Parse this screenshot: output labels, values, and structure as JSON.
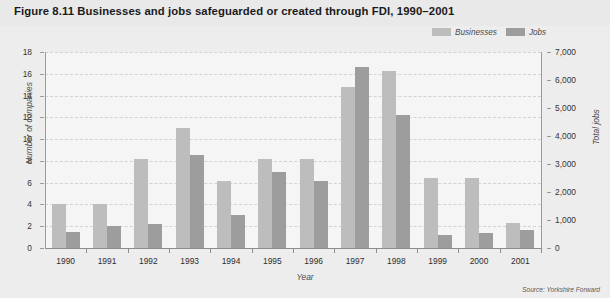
{
  "figure": {
    "title": "Figure 8.11  Businesses and jobs safeguarded or created through FDI, 1990–2001",
    "source": "Source: Yorkshire Forward"
  },
  "legend": {
    "position": "top-right",
    "items": [
      {
        "label": "Businesses",
        "color": "#bdbdbd"
      },
      {
        "label": "Jobs",
        "color": "#9d9d9d"
      }
    ]
  },
  "colors": {
    "businesses": "#bdbdbd",
    "jobs": "#9d9d9d",
    "plot_background": "#f5f5f5",
    "page_background": "#ededee",
    "gridline": "#d2d2d2",
    "axis": "#9a9a9a"
  },
  "chart_data": {
    "type": "bar",
    "title": "Figure 8.11  Businesses and jobs safeguarded or created through FDI, 1990–2001",
    "xlabel": "Year",
    "ylabel": "Number of companies",
    "y2label": "Total jobs",
    "categories": [
      "1990",
      "1991",
      "1992",
      "1993",
      "1994",
      "1995",
      "1996",
      "1997",
      "1998",
      "1999",
      "2000",
      "2001"
    ],
    "series": [
      {
        "name": "Businesses",
        "axis": "left",
        "unit": "companies",
        "color": "#bdbdbd",
        "values": [
          4.0,
          4.0,
          8.2,
          11.0,
          6.2,
          8.2,
          8.2,
          14.8,
          16.3,
          6.4,
          6.4,
          2.3
        ]
      },
      {
        "name": "Jobs",
        "axis": "right",
        "unit": "jobs",
        "color": "#9d9d9d",
        "values_left_scale": [
          1.5,
          2.0,
          2.2,
          8.5,
          3.0,
          7.0,
          6.2,
          16.6,
          12.2,
          1.2,
          1.4,
          1.7
        ],
        "values": [
          583,
          778,
          856,
          3306,
          1167,
          2722,
          2411,
          6456,
          4744,
          467,
          544,
          661
        ]
      }
    ],
    "ylim": [
      0,
      18
    ],
    "yticks": [
      "0",
      "2",
      "4",
      "6",
      "8",
      "10",
      "12",
      "14",
      "16",
      "18"
    ],
    "y2lim": [
      0,
      7000
    ],
    "y2ticks": [
      "0",
      "1,000",
      "2,000",
      "3,000",
      "4,000",
      "5,000",
      "6,000",
      "7,000"
    ],
    "grid": true,
    "legend_position": "top-right"
  },
  "axes": {
    "left": {
      "title": "Number of companies",
      "ticks": [
        "18",
        "16",
        "14",
        "12",
        "10",
        "8",
        "6",
        "4",
        "2",
        "0"
      ]
    },
    "right": {
      "title": "Total jobs",
      "ticks": [
        "7,000",
        "6,000",
        "5,000",
        "4,000",
        "3,000",
        "2,000",
        "1,000",
        "0"
      ]
    },
    "bottom": {
      "title": "Year",
      "ticks": [
        "1990",
        "1991",
        "1992",
        "1993",
        "1994",
        "1995",
        "1996",
        "1997",
        "1998",
        "1999",
        "2000",
        "2001"
      ]
    }
  }
}
